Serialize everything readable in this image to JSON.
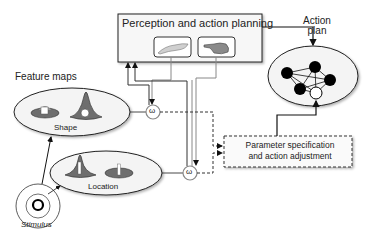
{
  "diagram": {
    "perception_box": {
      "title": "Perception and action planning"
    },
    "action_plan": {
      "label_line1": "Action",
      "label_line2": "plan"
    },
    "feature_maps": {
      "title": "Feature maps",
      "shape_map": {
        "label": "Shape"
      },
      "location_map": {
        "label": "Location"
      }
    },
    "stimulus": {
      "label": "Stimulus"
    },
    "integrator_symbol": "ω",
    "parameter_box": {
      "line1": "Parameter specification",
      "line2": "and action adjustment"
    },
    "colors": {
      "line": "#111111",
      "gray_line": "#8a8a8a",
      "ellipse_fill": "#f4f4f4",
      "feature_fill": "#6e6e6e",
      "node_fill": "#000000"
    }
  }
}
